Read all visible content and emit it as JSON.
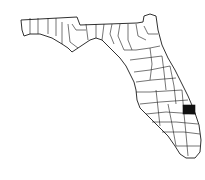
{
  "map": {
    "region": "Florida",
    "subdivision": "counties",
    "highlighted_county": "St. Lucie County",
    "colors": {
      "background": "#ffffff",
      "border": "#1a1a1a",
      "highlight": "#111111"
    }
  }
}
